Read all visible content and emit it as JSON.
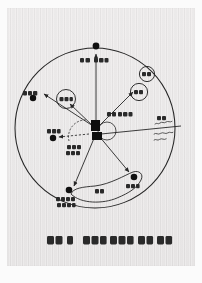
{
  "page": {
    "kind": "scanned-book-page",
    "background_color": "#ffffff",
    "sheet_color": "#eceaea",
    "ink_color": "#262626"
  },
  "figure": {
    "title_visible": false,
    "outer_boundary": {
      "shape": "circle",
      "name": "metropolitan-boundary-circle",
      "center": [
        95,
        128
      ],
      "radius": 82
    },
    "center_hub": {
      "name": "city-center-block",
      "label": "",
      "shape": "filled-rectangles"
    },
    "inner_dashed_arc": {
      "name": "inner-dashed-arc",
      "style": "dashed"
    },
    "inner_small_circle": {
      "name": "inner-small-circle",
      "style": "solid-thin"
    },
    "circled_labels": [
      {
        "name": "circled-label-left",
        "text": "일산",
        "cx": 63,
        "cy": 93,
        "r": 10
      },
      {
        "name": "circled-label-upper-right",
        "text": "분당",
        "cx": 147,
        "cy": 72,
        "r": 8
      },
      {
        "name": "circled-label-right",
        "text": "중동",
        "cx": 139,
        "cy": 90,
        "r": 9
      }
    ],
    "nodes": [
      {
        "name": "node-north",
        "text": "의정부 방면",
        "x": 104,
        "y": 47,
        "label_dx": -16,
        "label_dy": 10
      },
      {
        "name": "node-northwest",
        "text": "문산방면",
        "x": 32,
        "y": 99,
        "label_dx": -16,
        "label_dy": -7
      },
      {
        "name": "node-west",
        "text": "김포방면",
        "x": 54,
        "y": 138,
        "label_dx": -7,
        "label_dy": -8
      },
      {
        "name": "node-south",
        "text": "안양·광명\n수원방면",
        "x": 86,
        "y": 184,
        "label_dx": -16,
        "label_dy": 11
      },
      {
        "name": "node-southeast",
        "text": "성남방면",
        "x": 134,
        "y": 170,
        "label_dx": -8,
        "label_dy": 11
      }
    ],
    "blob": {
      "name": "south-corridor-blob",
      "inner_text": "수지"
    },
    "inner_annotations": [
      {
        "name": "annotation-center-right",
        "text": "구로 · 영등포"
      },
      {
        "name": "annotation-center-lower-left",
        "text": "서울시\n외곽대"
      }
    ],
    "right_edge_annotation": {
      "name": "right-edge-annotation",
      "line1": "부평",
      "line2": "Urban Scale",
      "line3": "Balance"
    },
    "arrows": [
      {
        "name": "arrow-to-north",
        "from": "center",
        "to": "node-north"
      },
      {
        "name": "arrow-to-northwest",
        "from": "center",
        "to": "node-northwest"
      },
      {
        "name": "arrow-to-ilsan",
        "from": "center",
        "to": "circled-label-left"
      },
      {
        "name": "arrow-to-bundang",
        "from": "center",
        "to": "circled-label-right"
      },
      {
        "name": "arrow-to-west",
        "from": "center",
        "to": "node-west",
        "style": "dashed"
      },
      {
        "name": "arrow-to-south",
        "from": "center",
        "to": "node-south"
      },
      {
        "name": "arrow-to-southeast",
        "from": "center",
        "to": "node-southeast"
      },
      {
        "name": "arrow-to-right-edge",
        "from": "center",
        "to": "right-edge-annotation"
      }
    ]
  },
  "caption": {
    "name": "figure-caption",
    "figure_label": "도표 2",
    "text": "서울시 수도권으로 발달 지역구분"
  }
}
